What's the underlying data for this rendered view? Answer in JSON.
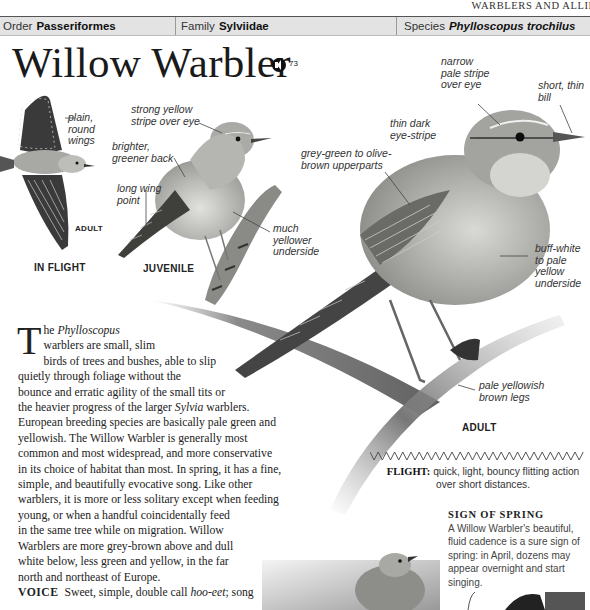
{
  "running_head": "WARBLERS AND ALLIES",
  "taxonomy": {
    "order_label": "Order",
    "order_value": "Passeriformes",
    "family_label": "Family",
    "family_value": "Sylviidae",
    "species_label": "Species",
    "species_value": "Phylloscopus trochilus"
  },
  "title": "Willow Warbler",
  "audio": {
    "icon": "speaker-icon",
    "track": "73"
  },
  "illustrations": {
    "in_flight": {
      "caption": "IN FLIGHT",
      "age": "ADULT",
      "labels": [
        "plain,",
        "round",
        "wings"
      ]
    },
    "juvenile": {
      "caption": "JUVENILE",
      "labels": {
        "stripe": [
          "strong yellow",
          "stripe over eye"
        ],
        "back": [
          "brighter,",
          "greener back"
        ],
        "wing": [
          "long wing",
          "point"
        ],
        "underside": [
          "much",
          "yellower",
          "underside"
        ]
      }
    },
    "adult": {
      "caption": "ADULT",
      "labels": {
        "pale_stripe": [
          "narrow",
          "pale stripe",
          "over eye"
        ],
        "bill": [
          "short, thin",
          "bill"
        ],
        "eye_stripe": [
          "thin dark",
          "eye-stripe"
        ],
        "upperparts": [
          "grey-green to olive-",
          "brown upperparts"
        ],
        "underside": [
          "buff-white",
          "to pale",
          "yellow",
          "underside"
        ],
        "legs": [
          "pale yellowish",
          "brown legs"
        ]
      }
    }
  },
  "body": {
    "drop_cap": "T",
    "lines": [
      [
        "he ",
        {
          "i": "Phylloscopus"
        }
      ],
      [
        "warblers are small, slim"
      ],
      [
        "birds of trees and bushes, able to slip"
      ],
      [
        "quietly through foliage without the"
      ],
      [
        "bounce and erratic agility of the small tits or"
      ],
      [
        "the heavier progress of the larger ",
        {
          "i": "Sylvia"
        },
        " warblers."
      ],
      [
        "European breeding species are basically pale green and"
      ],
      [
        "yellowish. The Willow Warbler is generally most"
      ],
      [
        "common and most widespread, and more conservative"
      ],
      [
        "in its choice of habitat than most. In spring, it has a fine,"
      ],
      [
        "simple, and beautifully evocative song. Like other"
      ],
      [
        "warblers, it is more or less solitary except when feeding"
      ],
      [
        "young, or when a handful coincidentally feed"
      ],
      [
        "in the same tree while on migration. Willow"
      ],
      [
        "Warblers are more grey-brown above and dull"
      ],
      [
        "white below, less green and yellow, in the far"
      ],
      [
        "north and northeast of Europe."
      ]
    ],
    "voice_label": "VOICE",
    "voice_text_a": "Sweet, simple, double call ",
    "voice_call": "hoo-eet",
    "voice_text_b": "; song"
  },
  "flight": {
    "label": "FLIGHT:",
    "text": "quick, light, bouncy flitting action over short distances."
  },
  "sign_of_spring": {
    "title": "SIGN OF SPRING",
    "text": "A Willow Warbler's beautiful, fluid cadence is a sure sign of spring: in April, dozens may appear overnight and start singing."
  }
}
